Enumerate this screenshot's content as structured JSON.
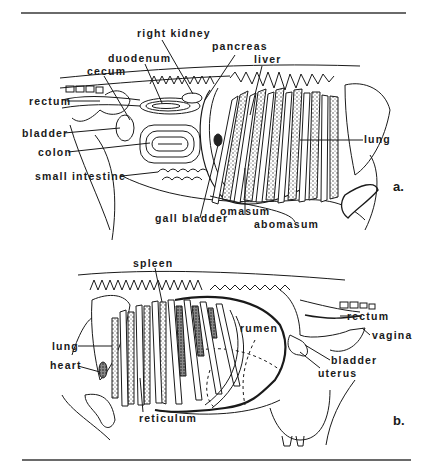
{
  "figure": {
    "panel_a": {
      "id": "a.",
      "labels": {
        "right_kidney": "right kidney",
        "duodenum": "duodenum",
        "cecum": "cecum",
        "rectum": "rectum",
        "bladder": "bladder",
        "colon": "colon",
        "small_intestine": "small intestine",
        "gall_bladder": "gall bladder",
        "pancreas": "pancreas",
        "liver": "liver",
        "lung": "lung",
        "omasum": "omasum",
        "abomasum": "abomasum"
      }
    },
    "panel_b": {
      "id": "b.",
      "labels": {
        "spleen": "spleen",
        "lung": "lung",
        "heart": "heart",
        "reticulum": "reticulum",
        "rumen": "rumen",
        "rectum": "rectum",
        "vagina": "vagina",
        "bladder": "bladder",
        "uterus": "uterus"
      }
    }
  },
  "colors": {
    "ink": "#1a1a1a",
    "rule": "#6a6a6a",
    "background": "#ffffff"
  }
}
